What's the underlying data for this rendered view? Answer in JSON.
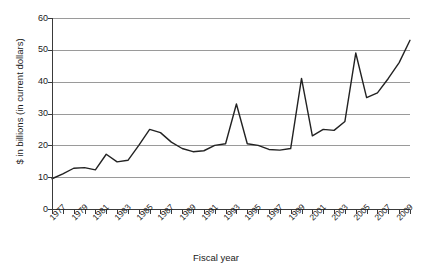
{
  "chart_data": {
    "type": "line",
    "title": "",
    "xlabel": "Fiscal year",
    "ylabel": "$ in billions (in current dollars)",
    "ylim": [
      0,
      60
    ],
    "ytick_values": [
      0,
      10,
      20,
      30,
      40,
      50,
      60
    ],
    "ytick_labels": [
      "0",
      "10",
      "20",
      "30",
      "40",
      "50",
      "60"
    ],
    "xlim": [
      1977,
      2010
    ],
    "grid": "horizontal",
    "legend": "none",
    "line_color": "#222222",
    "x": [
      1977,
      1978,
      1979,
      1980,
      1981,
      1982,
      1983,
      1984,
      1985,
      1986,
      1987,
      1988,
      1989,
      1990,
      1991,
      1992,
      1993,
      1994,
      1995,
      1996,
      1997,
      1998,
      1999,
      2000,
      2001,
      2002,
      2003,
      2004,
      2005,
      2006,
      2007,
      2008,
      2009,
      2010
    ],
    "series": [
      {
        "name": "$ in billions (in current dollars)",
        "values": [
          9.5,
          11.0,
          12.8,
          13.0,
          12.3,
          17.2,
          14.8,
          15.3,
          20.0,
          25.0,
          24.0,
          21.0,
          19.0,
          18.0,
          18.3,
          20.0,
          20.5,
          33.0,
          20.5,
          20.0,
          18.7,
          18.5,
          19.0,
          41.0,
          23.0,
          25.0,
          24.7,
          27.5,
          49.0,
          35.0,
          36.5,
          41.0,
          46.0,
          53.0
        ]
      }
    ],
    "xtick_years": [
      1977,
      1978,
      1979,
      1980,
      1981,
      1982,
      1983,
      1984,
      1985,
      1986,
      1987,
      1988,
      1989,
      1990,
      1991,
      1992,
      1993,
      1994,
      1995,
      1996,
      1997,
      1998,
      1999,
      2000,
      2001,
      2002,
      2003,
      2004,
      2005,
      2006,
      2007,
      2008,
      2009,
      2010
    ],
    "xtick_labeled_years": [
      1977,
      1979,
      1981,
      1983,
      1985,
      1987,
      1989,
      1991,
      1993,
      1995,
      1997,
      1999,
      2001,
      2003,
      2005,
      2007,
      2009
    ],
    "xtick_labels": [
      "1977",
      "1979",
      "1981",
      "1983",
      "1985",
      "1987",
      "1989",
      "1991",
      "1993",
      "1995",
      "1997",
      "1999",
      "2001",
      "2003",
      "2005",
      "2007",
      "2009"
    ]
  }
}
